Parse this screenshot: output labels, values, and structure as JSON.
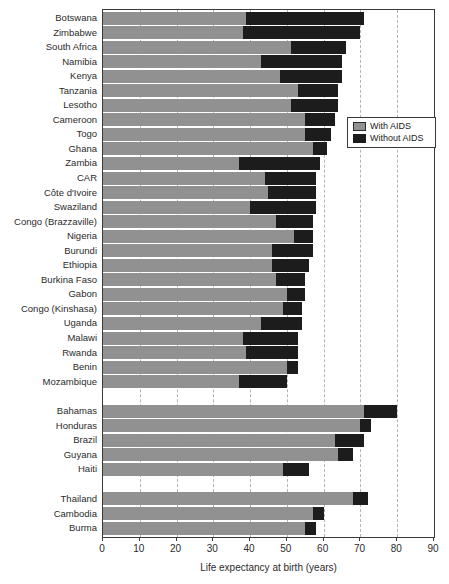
{
  "chart_data": {
    "type": "bar",
    "orientation": "horizontal",
    "title": "",
    "xlabel": "Life expectancy at birth (years)",
    "xlim": [
      0,
      90
    ],
    "xticks": [
      0,
      10,
      20,
      30,
      40,
      50,
      60,
      70,
      80,
      90
    ],
    "grid": "vertical dashed gridlines at 10-year intervals",
    "legend": {
      "position": "inside upper right",
      "items": [
        {
          "label": "With AIDS",
          "color": "#919191"
        },
        {
          "label": "Without AIDS",
          "color": "#1c1c1c"
        }
      ]
    },
    "series_note": "gray segment = life expectancy with AIDS; full bar (black end) = life expectancy without AIDS",
    "groups": [
      {
        "name": "africa",
        "rows": [
          {
            "label": "Botswana",
            "with_aids": 39,
            "without_aids": 71
          },
          {
            "label": "Zimbabwe",
            "with_aids": 38,
            "without_aids": 70
          },
          {
            "label": "South Africa",
            "with_aids": 51,
            "without_aids": 66
          },
          {
            "label": "Namibia",
            "with_aids": 43,
            "without_aids": 65
          },
          {
            "label": "Kenya",
            "with_aids": 48,
            "without_aids": 65
          },
          {
            "label": "Tanzania",
            "with_aids": 53,
            "without_aids": 64
          },
          {
            "label": "Lesotho",
            "with_aids": 51,
            "without_aids": 64
          },
          {
            "label": "Cameroon",
            "with_aids": 55,
            "without_aids": 63
          },
          {
            "label": "Togo",
            "with_aids": 55,
            "without_aids": 62
          },
          {
            "label": "Ghana",
            "with_aids": 57,
            "without_aids": 61
          },
          {
            "label": "Zambia",
            "with_aids": 37,
            "without_aids": 59
          },
          {
            "label": "CAR",
            "with_aids": 44,
            "without_aids": 58
          },
          {
            "label": "Côte d'Ivoire",
            "with_aids": 45,
            "without_aids": 58
          },
          {
            "label": "Swaziland",
            "with_aids": 40,
            "without_aids": 58
          },
          {
            "label": "Congo (Brazzaville)",
            "with_aids": 47,
            "without_aids": 57
          },
          {
            "label": "Nigeria",
            "with_aids": 52,
            "without_aids": 57
          },
          {
            "label": "Burundi",
            "with_aids": 46,
            "without_aids": 57
          },
          {
            "label": "Ethiopia",
            "with_aids": 46,
            "without_aids": 56
          },
          {
            "label": "Burkina Faso",
            "with_aids": 47,
            "without_aids": 55
          },
          {
            "label": "Gabon",
            "with_aids": 50,
            "without_aids": 55
          },
          {
            "label": "Congo (Kinshasa)",
            "with_aids": 49,
            "without_aids": 54
          },
          {
            "label": "Uganda",
            "with_aids": 43,
            "without_aids": 54
          },
          {
            "label": "Malawi",
            "with_aids": 38,
            "without_aids": 53
          },
          {
            "label": "Rwanda",
            "with_aids": 39,
            "without_aids": 53
          },
          {
            "label": "Benin",
            "with_aids": 50,
            "without_aids": 53
          },
          {
            "label": "Mozambique",
            "with_aids": 37,
            "without_aids": 50
          }
        ]
      },
      {
        "name": "americas",
        "rows": [
          {
            "label": "Bahamas",
            "with_aids": 71,
            "without_aids": 80
          },
          {
            "label": "Honduras",
            "with_aids": 70,
            "without_aids": 73
          },
          {
            "label": "Brazil",
            "with_aids": 63,
            "without_aids": 71
          },
          {
            "label": "Guyana",
            "with_aids": 64,
            "without_aids": 68
          },
          {
            "label": "Haiti",
            "with_aids": 49,
            "without_aids": 56
          }
        ]
      },
      {
        "name": "asia",
        "rows": [
          {
            "label": "Thailand",
            "with_aids": 68,
            "without_aids": 72
          },
          {
            "label": "Cambodia",
            "with_aids": 57,
            "without_aids": 60
          },
          {
            "label": "Burma",
            "with_aids": 55,
            "without_aids": 58
          }
        ]
      }
    ]
  },
  "colors": {
    "bar_with_aids": "#919191",
    "bar_without_aids": "#1c1c1c",
    "gridline": "#b4b4b4",
    "frame": "#3a3a3a",
    "text": "#2b2b2b",
    "background": "#ffffff"
  }
}
